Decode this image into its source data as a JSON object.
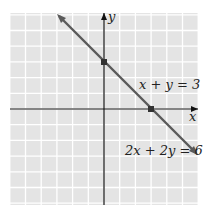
{
  "chart_data": {
    "type": "line",
    "title": "",
    "xlabel": "x",
    "ylabel": "y",
    "xlim": [
      -6,
      6
    ],
    "ylim": [
      -6,
      6
    ],
    "grid": true,
    "series": [
      {
        "name": "x + y = 3 / 2x + 2y = 6",
        "x": [
          -3,
          6
        ],
        "y": [
          6,
          -3
        ],
        "points": [
          {
            "x": 0,
            "y": 3
          },
          {
            "x": 3,
            "y": 0
          }
        ]
      }
    ],
    "annotations": [
      "x + y = 3",
      "2x + 2y = 6"
    ]
  },
  "labels": {
    "x_axis": "x",
    "y_axis": "y",
    "eq1": "x + y = 3",
    "eq2": "2x + 2y = 6"
  },
  "colors": {
    "grid_bg": "#e4e4e4",
    "grid_line": "#ffffff",
    "line": "#5a5a5a",
    "axis": "#111111"
  }
}
